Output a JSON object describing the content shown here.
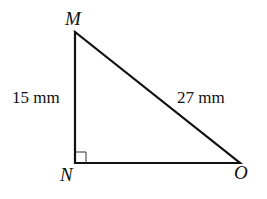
{
  "diagram": {
    "type": "right-triangle",
    "vertices": {
      "M": {
        "label": "M",
        "x": 75,
        "y": 32
      },
      "N": {
        "label": "N",
        "x": 75,
        "y": 163
      },
      "O": {
        "label": "O",
        "x": 240,
        "y": 163
      }
    },
    "right_angle_at": "N",
    "sides": {
      "MN": {
        "label": "15 mm"
      },
      "MO": {
        "label": "27 mm"
      }
    },
    "colors": {
      "stroke": "#111111",
      "background": "#ffffff"
    }
  }
}
